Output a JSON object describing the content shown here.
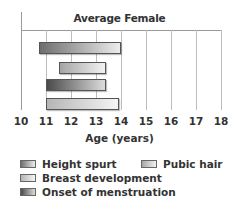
{
  "chart_data": {
    "type": "bar",
    "orientation": "horizontal-range",
    "title": "Average Female",
    "xlabel": "Age (years)",
    "ylabel": "",
    "xlim": [
      10,
      18
    ],
    "x_ticks": [
      "10",
      "11",
      "12",
      "13",
      "14",
      "15",
      "16",
      "17",
      "18"
    ],
    "grid": true,
    "legend_position": "bottom",
    "series": [
      {
        "name": "Height spurt",
        "start": 10.7,
        "end": 14.0,
        "color_from": "#6e6e6e",
        "color_to": "#ececec"
      },
      {
        "name": "Pubic hair",
        "start": 11.5,
        "end": 13.4,
        "color_from": "#a5a5a5",
        "color_to": "#f2f2f2"
      },
      {
        "name": "Onset of menstruation",
        "start": 11.0,
        "end": 13.4,
        "color_from": "#4a4a4a",
        "color_to": "#dcdcdc"
      },
      {
        "name": "Breast development",
        "start": 11.0,
        "end": 13.9,
        "color_from": "#b5b5b5",
        "color_to": "#f5f5f5"
      }
    ]
  },
  "legend": {
    "height_spurt": "Height spurt",
    "pubic_hair": "Pubic hair",
    "breast_development": "Breast development",
    "onset_of_menstruation": "Onset of menstruation"
  }
}
